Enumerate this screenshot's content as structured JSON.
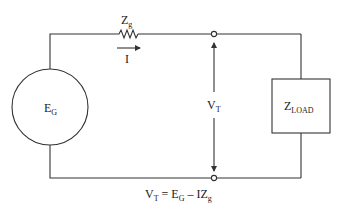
{
  "diagram": {
    "type": "circuit-schematic",
    "components": {
      "source": {
        "label_main": "E",
        "label_sub": "G",
        "shape": "circle"
      },
      "series_impedance": {
        "label_main": "Z",
        "label_sub": "g",
        "shape": "resistor-zigzag"
      },
      "current": {
        "label": "I",
        "direction": "right"
      },
      "load": {
        "label_main": "Z",
        "label_sub": "LOAD",
        "shape": "box"
      },
      "terminal_voltage": {
        "label_main": "V",
        "label_sub": "T"
      }
    },
    "equation": {
      "v": "V",
      "v_sub": "T",
      "eq": " = ",
      "e": "E",
      "e_sub": "G",
      "minus": " – IZ",
      "z_sub": "g"
    },
    "colors": {
      "line": "#333333",
      "text": "#1a1a1a",
      "background": "#ffffff"
    }
  }
}
